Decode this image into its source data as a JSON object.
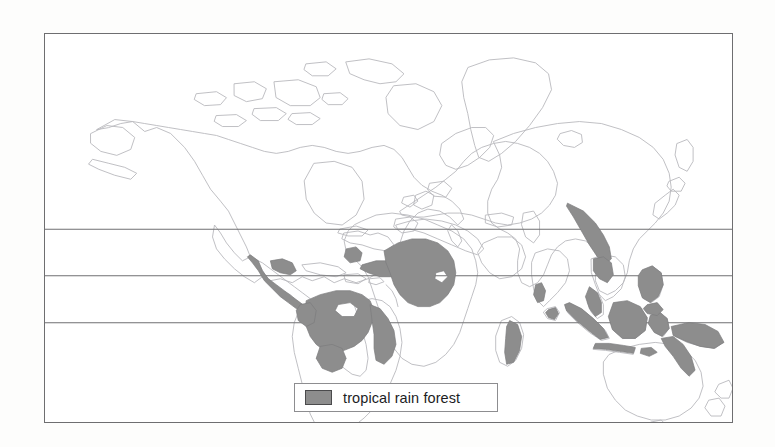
{
  "figure": {
    "kind": "world-map",
    "title": "",
    "background_color": "#fdfdfc",
    "frame": {
      "border_color": "#6e6e70",
      "fill_color": "#ffffff"
    }
  },
  "legend": {
    "label": "tropical rain forest",
    "swatch_color": "#8d8d8d",
    "swatch_border_color": "#4a4a4c",
    "box_border_color": "#8d8d90"
  },
  "map": {
    "coastline_color": "#b9b9bd",
    "highlight_color": "#8d8d8d",
    "highlight_stroke_color": "#7c7c7e",
    "graticule_color": "#6f6f72",
    "latitude_lines": [
      {
        "name": "tropic-of-cancer",
        "label": "",
        "y_fraction": 0.503
      },
      {
        "name": "equator",
        "label": "",
        "y_fraction": 0.623
      },
      {
        "name": "tropic-of-capricorn",
        "label": "",
        "y_fraction": 0.744
      }
    ],
    "highlight_regions": [
      "central-america",
      "amazon-basin",
      "brazil-atlantic-coast",
      "congo-basin",
      "west-africa-guinea-coast",
      "madagascar-east-coast",
      "western-ghats-india",
      "sri-lanka",
      "indochina-peninsula",
      "malay-peninsula",
      "sumatra",
      "borneo",
      "java",
      "sulawesi",
      "philippines",
      "new-guinea",
      "australia-northeast-coast"
    ]
  }
}
